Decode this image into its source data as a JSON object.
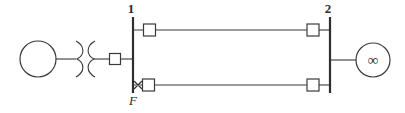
{
  "diagram": {
    "type": "power-system-one-line-diagram",
    "title": "",
    "background_color": "#ffffff",
    "line_color": "#3a3a3a",
    "bus_color": "#2e2e2e",
    "text_color": "#2b2b2b",
    "width": 405,
    "height": 113
  },
  "buses": [
    {
      "id": "bus-1",
      "label": "1",
      "x": 133,
      "y_top": 17,
      "y_bottom": 93,
      "label_x": 131,
      "label_y": 13
    },
    {
      "id": "bus-2",
      "label": "2",
      "x": 330,
      "y_top": 17,
      "y_bottom": 93,
      "label_x": 328,
      "label_y": 13
    }
  ],
  "generator": {
    "label": "",
    "symbol": "generator-circle",
    "cx": 38,
    "cy": 59,
    "r": 18
  },
  "infinite_bus": {
    "label": "∞",
    "symbol": "infinite-bus-circle",
    "cx": 373,
    "cy": 60,
    "r": 17
  },
  "transformer": {
    "symbol": "two-winding-transformer",
    "left_x": 76,
    "right_x": 95,
    "cy": 59
  },
  "breakers": [
    {
      "id": "breaker-gen-bus1",
      "x": 115,
      "y": 59,
      "size": 11
    },
    {
      "id": "breaker-line1-bus1",
      "x": 150,
      "y": 30,
      "size": 12
    },
    {
      "id": "breaker-line1-bus2",
      "x": 313,
      "y": 30,
      "size": 12
    },
    {
      "id": "breaker-line2-bus1",
      "x": 149,
      "y": 85,
      "size": 12
    },
    {
      "id": "breaker-line2-bus2",
      "x": 313,
      "y": 85,
      "size": 12
    }
  ],
  "transmission_lines": [
    {
      "id": "line-upper",
      "y": 30,
      "x_start": 133,
      "x_end": 330
    },
    {
      "id": "line-lower",
      "y": 85,
      "x_start": 133,
      "x_end": 330
    }
  ],
  "fault": {
    "label": "F",
    "marker": "fault-cross",
    "x": 138,
    "y": 85,
    "label_x": 133,
    "label_y": 105
  }
}
